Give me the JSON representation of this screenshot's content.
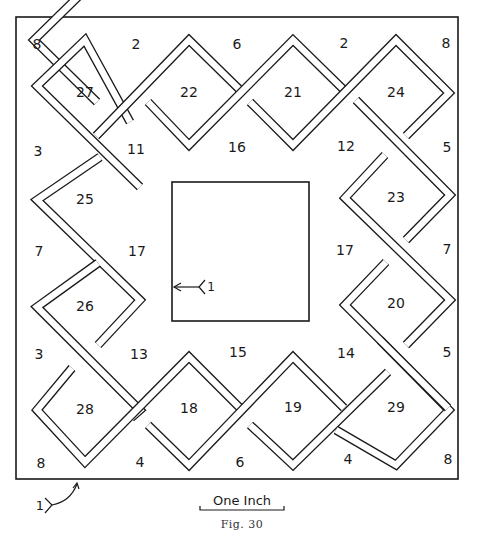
{
  "figure": {
    "caption": "Fig. 30",
    "scale_bar_label": "One Inch",
    "entrance_marker_label": "1",
    "goal_marker_label": "1"
  },
  "diamonds": [
    {
      "id": "27",
      "cx": 85,
      "cy": 93
    },
    {
      "id": "22",
      "cx": 189,
      "cy": 93
    },
    {
      "id": "21",
      "cx": 293,
      "cy": 93
    },
    {
      "id": "24",
      "cx": 396,
      "cy": 93
    },
    {
      "id": "25",
      "cx": 85,
      "cy": 200
    },
    {
      "id": "26",
      "cx": 85,
      "cy": 307
    },
    {
      "id": "28",
      "cx": 85,
      "cy": 410
    },
    {
      "id": "23",
      "cx": 396,
      "cy": 198
    },
    {
      "id": "20",
      "cx": 396,
      "cy": 304
    },
    {
      "id": "29",
      "cx": 396,
      "cy": 408
    },
    {
      "id": "18",
      "cx": 189,
      "cy": 409
    },
    {
      "id": "19",
      "cx": 293,
      "cy": 408
    }
  ],
  "region_labels": [
    {
      "text": "8",
      "x": 37,
      "y": 45
    },
    {
      "text": "2",
      "x": 136,
      "y": 45
    },
    {
      "text": "6",
      "x": 237,
      "y": 45
    },
    {
      "text": "2",
      "x": 344,
      "y": 44
    },
    {
      "text": "8",
      "x": 446,
      "y": 44
    },
    {
      "text": "3",
      "x": 38,
      "y": 152
    },
    {
      "text": "11",
      "x": 136,
      "y": 150
    },
    {
      "text": "16",
      "x": 237,
      "y": 148
    },
    {
      "text": "12",
      "x": 346,
      "y": 147
    },
    {
      "text": "5",
      "x": 447,
      "y": 148
    },
    {
      "text": "7",
      "x": 39,
      "y": 252
    },
    {
      "text": "17",
      "x": 137,
      "y": 252
    },
    {
      "text": "17",
      "x": 345,
      "y": 251
    },
    {
      "text": "7",
      "x": 447,
      "y": 250
    },
    {
      "text": "3",
      "x": 39,
      "y": 355
    },
    {
      "text": "13",
      "x": 139,
      "y": 355
    },
    {
      "text": "15",
      "x": 238,
      "y": 353
    },
    {
      "text": "14",
      "x": 346,
      "y": 354
    },
    {
      "text": "5",
      "x": 447,
      "y": 353
    },
    {
      "text": "8",
      "x": 41,
      "y": 464
    },
    {
      "text": "4",
      "x": 140,
      "y": 463
    },
    {
      "text": "6",
      "x": 240,
      "y": 463
    },
    {
      "text": "4",
      "x": 348,
      "y": 460
    },
    {
      "text": "8",
      "x": 448,
      "y": 460
    }
  ],
  "colors": {
    "ink": "#1a1a1a",
    "paper": "#ffffff",
    "caption": "#333333"
  }
}
